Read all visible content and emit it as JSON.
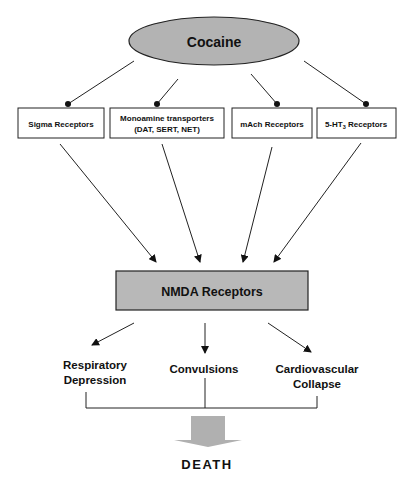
{
  "diagram": {
    "source": {
      "label": "Cocaine",
      "fill": "#b3b3b3"
    },
    "receptors": [
      {
        "id": "sigma",
        "lines": [
          "Sigma Receptors"
        ]
      },
      {
        "id": "monoamine",
        "lines": [
          "Monoamine transporters",
          "(DAT, SERT, NET)"
        ]
      },
      {
        "id": "mach",
        "lines": [
          "mAch Receptors"
        ]
      },
      {
        "id": "5ht3",
        "lines": [
          "5-HT",
          "3",
          " Receptors"
        ]
      }
    ],
    "target": {
      "label": "NMDA Receptors",
      "fill": "#b8b8b8"
    },
    "effects": [
      {
        "id": "respiratory",
        "lines": [
          "Respiratory",
          "Depression"
        ]
      },
      {
        "id": "convulsions",
        "lines": [
          "Convulsions"
        ]
      },
      {
        "id": "cardiovascular",
        "lines": [
          "Cardiovascular",
          "Collapse"
        ]
      }
    ],
    "outcome": {
      "label": "DEATH",
      "arrow_fill": "#b0b0b0"
    }
  }
}
